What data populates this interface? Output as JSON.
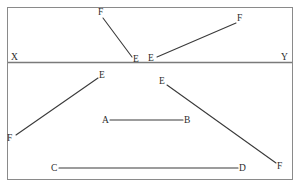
{
  "figure": {
    "caption": "",
    "colors": {
      "frame": "#8a8a8a",
      "divider": "#7a7a7a",
      "segment": "#3a3a3a",
      "label": "#2b2b2b",
      "background": "#ffffff"
    },
    "frame": {
      "x": 7,
      "y": 7,
      "width": 286,
      "height": 173
    },
    "divider": {
      "x1": 8,
      "y1": 62,
      "x2": 292,
      "y2": 62,
      "label_left": "X",
      "label_right": "Y"
    },
    "panels": [
      {
        "name": "upper-panel",
        "segments": [
          {
            "name": "segment-FE-upper-left",
            "from_label": "F",
            "to_label": "E",
            "x1": 103,
            "y1": 18,
            "x2": 132,
            "y2": 57
          },
          {
            "name": "segment-EF-upper-right",
            "from_label": "E",
            "to_label": "F",
            "x1": 157,
            "y1": 57,
            "x2": 236,
            "y2": 23
          }
        ],
        "labels": [
          {
            "name": "label-F-upper-left",
            "text": "F",
            "x": 98,
            "y": 15
          },
          {
            "name": "label-E-upper-left",
            "text": "E",
            "x": 133,
            "y": 62
          },
          {
            "name": "label-E-upper-right",
            "text": "E",
            "x": 148,
            "y": 61
          },
          {
            "name": "label-F-upper-right",
            "text": "F",
            "x": 237,
            "y": 21
          },
          {
            "name": "label-X",
            "text": "X",
            "x": 11,
            "y": 60
          },
          {
            "name": "label-Y",
            "text": "Y",
            "x": 281,
            "y": 60
          }
        ]
      },
      {
        "name": "lower-panel",
        "segments": [
          {
            "name": "segment-FE-lower-left",
            "from_label": "F",
            "to_label": "E",
            "x1": 16,
            "y1": 135,
            "x2": 98,
            "y2": 78
          },
          {
            "name": "segment-EF-lower-right",
            "from_label": "E",
            "to_label": "F",
            "x1": 167,
            "y1": 85,
            "x2": 276,
            "y2": 163
          },
          {
            "name": "segment-AB",
            "from_label": "A",
            "to_label": "B",
            "x1": 110,
            "y1": 120,
            "x2": 183,
            "y2": 120
          },
          {
            "name": "segment-CD",
            "from_label": "C",
            "to_label": "D",
            "x1": 59,
            "y1": 168,
            "x2": 238,
            "y2": 168
          }
        ],
        "labels": [
          {
            "name": "label-E-lower-left",
            "text": "E",
            "x": 99,
            "y": 78
          },
          {
            "name": "label-F-lower-left",
            "text": "F",
            "x": 7,
            "y": 141
          },
          {
            "name": "label-E-lower-right",
            "text": "E",
            "x": 159,
            "y": 84
          },
          {
            "name": "label-F-lower-right",
            "text": "F",
            "x": 277,
            "y": 169
          },
          {
            "name": "label-A",
            "text": "A",
            "x": 102,
            "y": 123
          },
          {
            "name": "label-B",
            "text": "B",
            "x": 184,
            "y": 123
          },
          {
            "name": "label-C",
            "text": "C",
            "x": 51,
            "y": 171
          },
          {
            "name": "label-D",
            "text": "D",
            "x": 239,
            "y": 171
          }
        ]
      }
    ]
  }
}
